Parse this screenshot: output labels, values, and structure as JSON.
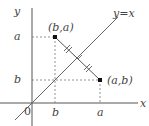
{
  "diagram": {
    "axes": {
      "x_label": "x",
      "y_label": "y",
      "origin_label": "0"
    },
    "line": {
      "label": "y=x"
    },
    "points": [
      {
        "id": "P1",
        "label": "(b,a)"
      },
      {
        "id": "P2",
        "label": "(a,b)"
      }
    ],
    "x_ticks": [
      "b",
      "a"
    ],
    "y_ticks": [
      "a",
      "b"
    ],
    "colors": {
      "axis": "#555555",
      "line": "#666666",
      "dashed": "#777777",
      "point": "#111111",
      "text": "#444444"
    }
  }
}
